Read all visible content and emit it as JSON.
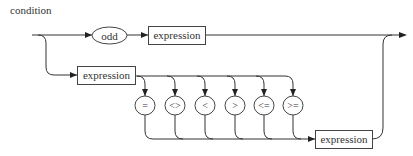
{
  "diagram": {
    "title": "condition",
    "type": "railroad-syntax-diagram",
    "branch_odd": {
      "keyword": "odd",
      "nonterminal": "expression"
    },
    "branch_compare": {
      "left_nonterminal": "expression",
      "operators": [
        "=",
        "<>",
        "<",
        ">",
        "<=",
        ">="
      ],
      "right_nonterminal": "expression"
    }
  }
}
